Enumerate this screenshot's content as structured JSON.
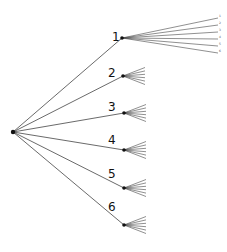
{
  "diagram": {
    "type": "tree",
    "root": {
      "x": 13,
      "y": 132
    },
    "line_color": "#444444",
    "node_color": "#111111",
    "branches": [
      {
        "label": "1",
        "node": {
          "x": 122,
          "y": 38
        },
        "label_pos": {
          "x": 112,
          "y": 41
        },
        "expanded": true,
        "children": [
          {
            "label": "1",
            "end": {
              "x": 218,
              "y": 18
            }
          },
          {
            "label": "2",
            "end": {
              "x": 218,
              "y": 25
            }
          },
          {
            "label": "3",
            "end": {
              "x": 218,
              "y": 32
            }
          },
          {
            "label": "4",
            "end": {
              "x": 218,
              "y": 39
            }
          },
          {
            "label": "5",
            "end": {
              "x": 218,
              "y": 46
            }
          },
          {
            "label": "6",
            "end": {
              "x": 218,
              "y": 53
            }
          }
        ]
      },
      {
        "label": "2",
        "node": {
          "x": 123,
          "y": 76
        },
        "label_pos": {
          "x": 108,
          "y": 77
        }
      },
      {
        "label": "3",
        "node": {
          "x": 124,
          "y": 113
        },
        "label_pos": {
          "x": 108,
          "y": 111
        }
      },
      {
        "label": "4",
        "node": {
          "x": 124,
          "y": 150
        },
        "label_pos": {
          "x": 108,
          "y": 144
        }
      },
      {
        "label": "5",
        "node": {
          "x": 124,
          "y": 188
        },
        "label_pos": {
          "x": 108,
          "y": 178
        }
      },
      {
        "label": "6",
        "node": {
          "x": 124,
          "y": 225
        },
        "label_pos": {
          "x": 108,
          "y": 211
        }
      }
    ]
  }
}
